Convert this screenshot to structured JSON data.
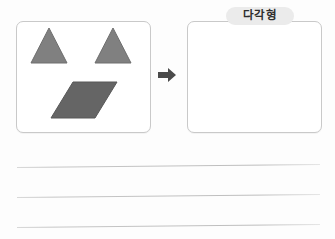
{
  "worksheet": {
    "name": "shape-classification-worksheet",
    "source_panel": {
      "name": "source-shape-panel",
      "shapes": [
        {
          "id": "triangle-left",
          "type": "triangle",
          "color": "#808080",
          "stroke": "#6e6e6e",
          "points": "14,41 32,6 50,41"
        },
        {
          "id": "triangle-right",
          "type": "triangle",
          "color": "#808080",
          "stroke": "#6e6e6e",
          "points": "78,41 96,6 114,41"
        },
        {
          "id": "parallelogram",
          "type": "parallelogram",
          "color": "#656565",
          "stroke": "#585858",
          "points": "56,60 100,60 78,96 34,96"
        }
      ]
    },
    "arrow": {
      "name": "transform-arrow",
      "icon": "arrow-right-icon",
      "color": "#4a4a4a",
      "direction": "right"
    },
    "target_panel": {
      "name": "target-answer-panel",
      "badge_label": "다각형",
      "badge_color": "#ebebeb",
      "content": ""
    },
    "writing_lines": [
      {
        "name": "writing-line-1",
        "value": ""
      },
      {
        "name": "writing-line-2",
        "value": ""
      },
      {
        "name": "writing-line-3",
        "value": ""
      }
    ]
  }
}
